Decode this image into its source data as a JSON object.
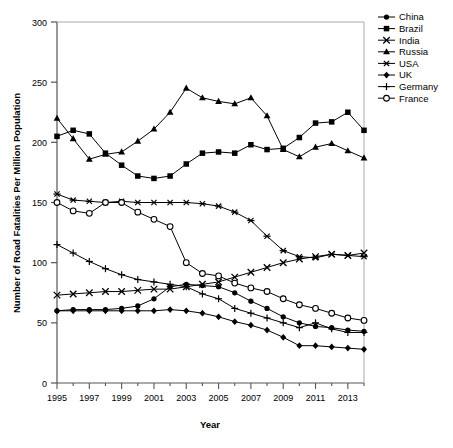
{
  "chart_data": {
    "type": "line",
    "title": "",
    "xlabel": "Year",
    "ylabel": "Number of Road Fatalities Per Million Population",
    "xlim": [
      1995,
      2014
    ],
    "ylim": [
      0,
      300
    ],
    "yticks": [
      0,
      50,
      100,
      150,
      200,
      250,
      300
    ],
    "xticks": [
      1995,
      1997,
      1999,
      2001,
      2003,
      2005,
      2007,
      2009,
      2011,
      2013
    ],
    "xtick_labels": [
      "1995",
      "1997",
      "1999",
      "2001",
      "2003",
      "2005",
      "2007",
      "2009",
      "2011",
      "2013"
    ],
    "ytick_labels": [
      "0",
      "50",
      "100",
      "150",
      "200",
      "250",
      "300"
    ],
    "grid": false,
    "legend_position": "top-right outside",
    "x": [
      1995,
      1996,
      1997,
      1998,
      1999,
      2000,
      2001,
      2002,
      2003,
      2004,
      2005,
      2006,
      2007,
      2008,
      2009,
      2010,
      2011,
      2012,
      2013,
      2014
    ],
    "series": [
      {
        "name": "China",
        "marker": "filled-circle",
        "color": "#000000",
        "values": [
          60,
          61,
          61,
          61,
          62,
          64,
          70,
          80,
          82,
          81,
          80,
          75,
          68,
          62,
          55,
          50,
          47,
          46,
          44,
          43
        ]
      },
      {
        "name": "Brazil",
        "marker": "filled-square",
        "color": "#000000",
        "values": [
          205,
          210,
          207,
          191,
          181,
          172,
          170,
          172,
          182,
          191,
          192,
          191,
          198,
          194,
          195,
          204,
          216,
          217,
          225,
          210
        ]
      },
      {
        "name": "India",
        "marker": "cross-x",
        "color": "#000000",
        "values": [
          73,
          74,
          75,
          76,
          76,
          77,
          78,
          78,
          80,
          82,
          84,
          88,
          92,
          96,
          100,
          103,
          105,
          107,
          106,
          108
        ]
      },
      {
        "name": "Russia",
        "marker": "filled-triangle",
        "color": "#000000",
        "values": [
          220,
          203,
          186,
          190,
          192,
          201,
          211,
          225,
          245,
          237,
          234,
          232,
          237,
          222,
          194,
          188,
          196,
          199,
          193,
          187
        ]
      },
      {
        "name": "USA",
        "marker": "asterisk",
        "color": "#000000",
        "values": [
          157,
          152,
          151,
          150,
          151,
          150,
          150,
          150,
          150,
          149,
          147,
          142,
          135,
          122,
          110,
          105,
          104,
          107,
          106,
          105
        ]
      },
      {
        "name": "UK",
        "marker": "filled-diamond",
        "color": "#000000",
        "values": [
          60,
          60,
          60,
          60,
          60,
          60,
          60,
          61,
          60,
          58,
          55,
          51,
          48,
          44,
          38,
          31,
          31,
          30,
          29,
          28
        ]
      },
      {
        "name": "Germany",
        "marker": "plus",
        "color": "#000000",
        "values": [
          115,
          108,
          101,
          95,
          90,
          86,
          84,
          82,
          80,
          74,
          70,
          62,
          58,
          54,
          50,
          46,
          50,
          45,
          42,
          42
        ]
      },
      {
        "name": "France",
        "marker": "open-circle",
        "color": "#000000",
        "values": [
          150,
          143,
          141,
          150,
          150,
          142,
          136,
          130,
          100,
          91,
          89,
          83,
          79,
          76,
          70,
          65,
          62,
          58,
          54,
          52
        ]
      }
    ]
  },
  "legend": {
    "items": [
      {
        "label": "China",
        "marker": "filled-circle"
      },
      {
        "label": "Brazil",
        "marker": "filled-square"
      },
      {
        "label": "India",
        "marker": "cross-x"
      },
      {
        "label": "Russia",
        "marker": "filled-triangle"
      },
      {
        "label": "USA",
        "marker": "asterisk"
      },
      {
        "label": "UK",
        "marker": "filled-diamond"
      },
      {
        "label": "Germany",
        "marker": "plus"
      },
      {
        "label": "France",
        "marker": "open-circle"
      }
    ]
  }
}
